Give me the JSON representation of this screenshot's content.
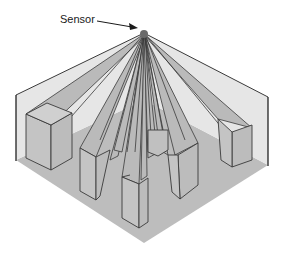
{
  "diagram": {
    "label_sensor": "Sensor",
    "colors": {
      "wall": "#e4e4e4",
      "floor": "#bdbdbd",
      "beam": "#b8b8b8",
      "box_side": "#c2c2c2",
      "box_top": "#cfcfcf",
      "stroke": "#3a3a3a",
      "sensor": "#6a6a6a"
    },
    "elements": [
      {
        "id": "sensor",
        "label": "Sensor"
      },
      {
        "id": "left-wall"
      },
      {
        "id": "right-wall"
      },
      {
        "id": "floor"
      },
      {
        "id": "obstacle-far-left"
      },
      {
        "id": "obstacle-mid-left"
      },
      {
        "id": "obstacle-center"
      },
      {
        "id": "obstacle-mid-right"
      },
      {
        "id": "obstacle-far-right"
      }
    ]
  }
}
